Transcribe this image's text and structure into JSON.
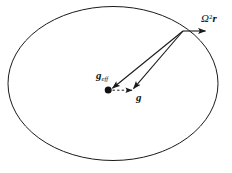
{
  "figure": {
    "background_color": "#ffffff",
    "stroke_color": "#1a1a1a",
    "width": 232,
    "height": 173
  },
  "shapes": {
    "ellipse": {
      "name": "oblate-body-outline",
      "cx": 113,
      "cy": 83.5,
      "rx": 105,
      "ry": 77,
      "stroke_width": 1
    },
    "center_dot": {
      "name": "center-point-marker",
      "cx": 108,
      "cy": 90,
      "r": 3.4
    },
    "vertex_point": {
      "name": "surface-vertex-point",
      "x": 183,
      "y": 31
    }
  },
  "vectors": [
    {
      "id": "omega2r",
      "name": "centrifugal-vector",
      "style": "solid",
      "from": {
        "x": 183,
        "y": 31
      },
      "to": {
        "x": 206,
        "y": 31
      },
      "label": "Ω²r"
    },
    {
      "id": "g-eff",
      "name": "effective-gravity-vector",
      "style": "solid",
      "from": {
        "x": 183,
        "y": 31
      },
      "to": {
        "x": 112,
        "y": 88
      },
      "label": "g_eff"
    },
    {
      "id": "g",
      "name": "gravity-vector",
      "style": "solid",
      "from": {
        "x": 183,
        "y": 31
      },
      "to": {
        "x": 133,
        "y": 89
      },
      "label": "g"
    },
    {
      "id": "g-horizontal",
      "name": "horizontal-dashed-vector",
      "style": "dashed",
      "from": {
        "x": 112,
        "y": 90
      },
      "to": {
        "x": 133,
        "y": 90
      },
      "label": ""
    }
  ],
  "labels": {
    "g_eff": {
      "symbol": "g",
      "subscript": "eff",
      "full_text": "g_eff"
    },
    "g": {
      "symbol": "g",
      "subscript": "",
      "full_text": "g"
    },
    "omega2r": {
      "symbol": "Ω",
      "superscript": "2",
      "variable": "r",
      "full_text": "Ω²r"
    }
  }
}
